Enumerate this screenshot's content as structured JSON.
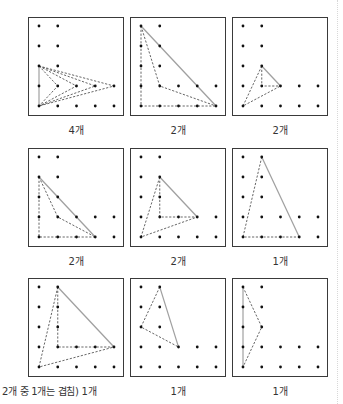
{
  "grid": {
    "dots": [
      [
        0,
        0
      ],
      [
        1,
        0
      ],
      [
        0,
        1
      ],
      [
        1,
        1
      ],
      [
        0,
        2
      ],
      [
        1,
        2
      ],
      [
        0,
        3
      ],
      [
        1,
        3
      ],
      [
        2,
        3
      ],
      [
        3,
        3
      ],
      [
        4,
        3
      ],
      [
        0,
        4
      ],
      [
        1,
        4
      ],
      [
        2,
        4
      ],
      [
        3,
        4
      ],
      [
        4,
        4
      ]
    ]
  },
  "colors": {
    "border": "#3a3a3a",
    "dot": "#111111",
    "solid_line": "#a0a0a0",
    "dashed_line": "#555555"
  },
  "panels": [
    {
      "label": "4개",
      "solid": [
        [
          [
            0,
            2
          ],
          [
            0,
            4
          ]
        ]
      ],
      "dashed": [
        [
          [
            0,
            2
          ],
          [
            1,
            3
          ],
          [
            0,
            4
          ]
        ],
        [
          [
            0,
            2
          ],
          [
            2,
            3
          ],
          [
            0,
            4
          ]
        ],
        [
          [
            0,
            2
          ],
          [
            3,
            3
          ],
          [
            0,
            4
          ]
        ],
        [
          [
            0,
            2
          ],
          [
            4,
            3
          ],
          [
            0,
            4
          ]
        ]
      ]
    },
    {
      "label": "2개",
      "solid": [
        [
          [
            0,
            0
          ],
          [
            4,
            4
          ]
        ]
      ],
      "dashed": [
        [
          [
            0,
            0
          ],
          [
            0,
            4
          ],
          [
            4,
            4
          ]
        ],
        [
          [
            0,
            0
          ],
          [
            1,
            3
          ],
          [
            4,
            4
          ]
        ]
      ]
    },
    {
      "label": "2개",
      "solid": [
        [
          [
            1,
            2
          ],
          [
            2,
            3
          ]
        ]
      ],
      "dashed": [
        [
          [
            1,
            2
          ],
          [
            1,
            3
          ],
          [
            2,
            3
          ]
        ],
        [
          [
            1,
            2
          ],
          [
            0,
            4
          ],
          [
            2,
            3
          ]
        ]
      ]
    },
    {
      "label": "2개",
      "solid": [
        [
          [
            0,
            1
          ],
          [
            3,
            4
          ]
        ]
      ],
      "dashed": [
        [
          [
            0,
            1
          ],
          [
            0,
            4
          ],
          [
            3,
            4
          ]
        ],
        [
          [
            0,
            1
          ],
          [
            1,
            3
          ],
          [
            3,
            4
          ]
        ]
      ]
    },
    {
      "label": "2개",
      "solid": [
        [
          [
            1,
            1
          ],
          [
            3,
            3
          ]
        ]
      ],
      "dashed": [
        [
          [
            1,
            1
          ],
          [
            1,
            3
          ],
          [
            3,
            3
          ]
        ],
        [
          [
            1,
            1
          ],
          [
            0,
            4
          ],
          [
            3,
            3
          ]
        ]
      ]
    },
    {
      "label": "1개",
      "solid": [
        [
          [
            1,
            0
          ],
          [
            3,
            4
          ]
        ]
      ],
      "dashed": [
        [
          [
            1,
            0
          ],
          [
            0,
            4
          ],
          [
            3,
            4
          ]
        ]
      ]
    },
    {
      "label": "2개 중 1개는 겹침) 1개",
      "solid": [
        [
          [
            1,
            0
          ],
          [
            4,
            3
          ]
        ]
      ],
      "dashed": [
        [
          [
            1,
            0
          ],
          [
            1,
            3
          ],
          [
            4,
            3
          ]
        ],
        [
          [
            1,
            0
          ],
          [
            0,
            4
          ],
          [
            4,
            3
          ]
        ]
      ]
    },
    {
      "label": "1개",
      "solid": [
        [
          [
            1,
            0
          ],
          [
            2,
            3
          ]
        ]
      ],
      "dashed": [
        [
          [
            1,
            0
          ],
          [
            0,
            2
          ],
          [
            2,
            3
          ]
        ]
      ]
    },
    {
      "label": "1개",
      "solid": [
        [
          [
            0,
            0
          ],
          [
            0,
            4
          ]
        ]
      ],
      "dashed": [
        [
          [
            0,
            0
          ],
          [
            1,
            2
          ],
          [
            0,
            4
          ]
        ]
      ]
    }
  ]
}
